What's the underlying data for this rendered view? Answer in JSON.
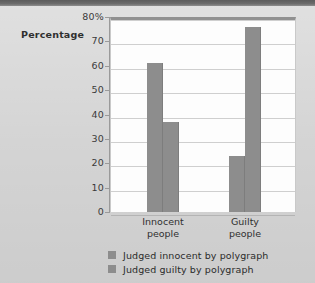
{
  "chart_data": {
    "type": "bar",
    "title": "",
    "xlabel": "",
    "ylabel": "Percentage",
    "ylim": [
      0,
      80
    ],
    "grid": true,
    "legend_position": "bottom",
    "categories": [
      "Innocent people",
      "Guilty people"
    ],
    "category_lines": [
      [
        "Innocent",
        "people"
      ],
      [
        "Guilty",
        "people"
      ]
    ],
    "series": [
      {
        "name": "Judged innocent by polygraph",
        "values": [
          61,
          23
        ],
        "color": "#8d8d8d"
      },
      {
        "name": "Judged guilty by polygraph",
        "values": [
          37,
          76
        ],
        "color": "#8d8d8d"
      }
    ],
    "y_ticks": [
      {
        "value": 80,
        "label": "80%"
      },
      {
        "value": 70,
        "label": "70"
      },
      {
        "value": 60,
        "label": "60"
      },
      {
        "value": 50,
        "label": "50"
      },
      {
        "value": 40,
        "label": "40"
      },
      {
        "value": 30,
        "label": "30"
      },
      {
        "value": 20,
        "label": "20"
      },
      {
        "value": 10,
        "label": "10"
      },
      {
        "value": 0,
        "label": "0"
      }
    ]
  },
  "axis": {
    "percentage_label": "Percentage"
  },
  "legend": {
    "items": [
      {
        "label": "Judged innocent by polygraph",
        "color": "#8d8d8d"
      },
      {
        "label": "Judged guilty by polygraph",
        "color": "#8d8d8d"
      }
    ]
  },
  "colors": {
    "bar": "#8d8d8d",
    "background": "#d3d3d3",
    "plot_background": "#fdfdfd",
    "gridline": "#cfcfcf",
    "top_band": "#6b6b6b"
  }
}
